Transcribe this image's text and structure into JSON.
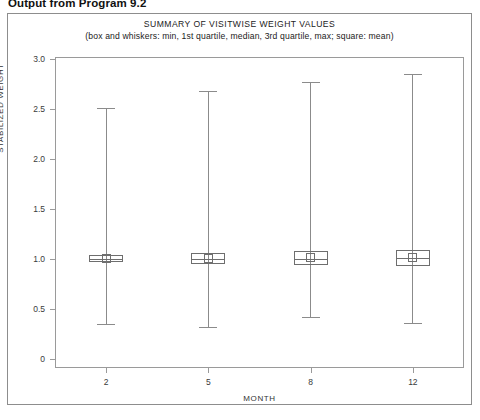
{
  "page": {
    "caption": "Output from Program 9.2"
  },
  "chart_data": {
    "type": "box",
    "title": "SUMMARY OF VISITWISE WEIGHT VALUES",
    "subtitle": "(box and whiskers: min, 1st quartile, median, 3rd quartile, max; square: mean)",
    "xlabel": "MONTH",
    "ylabel": "STABILIZED WEIGHT",
    "grid": false,
    "legend": "none",
    "ylim": [
      0,
      3.0
    ],
    "ytick_labels": [
      "3.0",
      "2.5",
      "2.0",
      "1.5",
      "1.0",
      "0.5",
      "0"
    ],
    "ytick_values": [
      3.0,
      2.5,
      2.0,
      1.5,
      1.0,
      0.5,
      0
    ],
    "categories": [
      "2",
      "5",
      "8",
      "12"
    ],
    "boxes": [
      {
        "category": "2",
        "min": 0.35,
        "q1": 0.97,
        "median": 1.0,
        "q3": 1.04,
        "max": 2.51,
        "mean": 1.01
      },
      {
        "category": "5",
        "min": 0.32,
        "q1": 0.95,
        "median": 1.0,
        "q3": 1.06,
        "max": 2.68,
        "mean": 1.01
      },
      {
        "category": "8",
        "min": 0.42,
        "q1": 0.94,
        "median": 1.0,
        "q3": 1.08,
        "max": 2.77,
        "mean": 1.02
      },
      {
        "category": "12",
        "min": 0.36,
        "q1": 0.93,
        "median": 1.01,
        "q3": 1.09,
        "max": 2.85,
        "mean": 1.02
      }
    ]
  },
  "colors": {
    "frame": "#9a9a9a",
    "glyph": "#6e6e6e",
    "whisker": "#8b8b8b",
    "text": "#222222"
  }
}
